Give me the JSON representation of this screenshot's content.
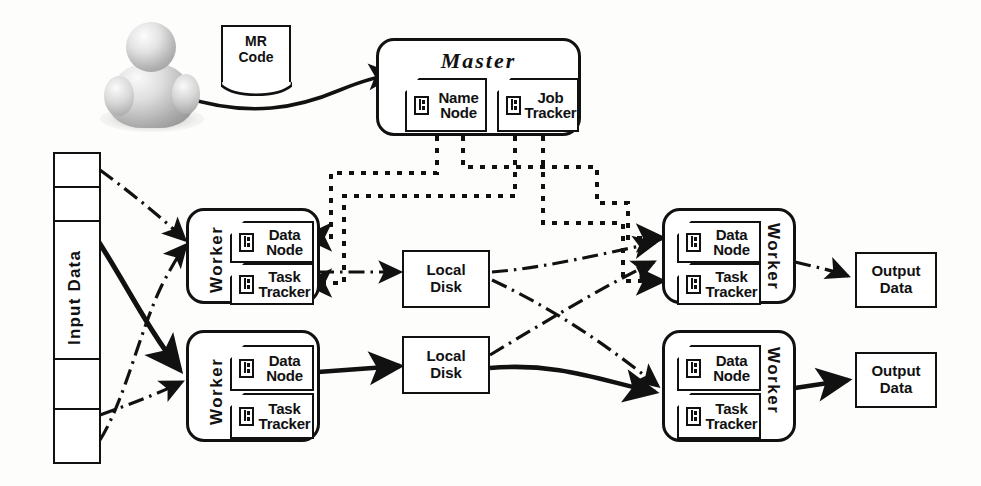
{
  "diagram": {
    "actor": {
      "name": "user",
      "icon": "person-icon"
    },
    "mr_code": {
      "label_line1": "MR",
      "label_line2": "Code",
      "icon": "document-icon"
    },
    "master": {
      "title": "Master",
      "components": [
        {
          "line1": "Name",
          "line2": "Node",
          "icon": "component-icon"
        },
        {
          "line1": "Job",
          "line2": "Tracker",
          "icon": "component-icon"
        }
      ]
    },
    "input": {
      "label": "Input Data",
      "segments": 6
    },
    "workers": [
      {
        "id": "worker-top-left",
        "label": "Worker",
        "label_side": "left",
        "components": [
          {
            "line1": "Data",
            "line2": "Node",
            "icon": "component-icon"
          },
          {
            "line1": "Task",
            "line2": "Tracker",
            "icon": "component-icon"
          }
        ]
      },
      {
        "id": "worker-bottom-left",
        "label": "Worker",
        "label_side": "left",
        "components": [
          {
            "line1": "Data",
            "line2": "Node",
            "icon": "component-icon"
          },
          {
            "line1": "Task",
            "line2": "Tracker",
            "icon": "component-icon"
          }
        ]
      },
      {
        "id": "worker-top-right",
        "label": "Worker",
        "label_side": "right",
        "components": [
          {
            "line1": "Data",
            "line2": "Node",
            "icon": "component-icon"
          },
          {
            "line1": "Task",
            "line2": "Tracker",
            "icon": "component-icon"
          }
        ]
      },
      {
        "id": "worker-bottom-right",
        "label": "Worker",
        "label_side": "right",
        "components": [
          {
            "line1": "Data",
            "line2": "Node",
            "icon": "component-icon"
          },
          {
            "line1": "Task",
            "line2": "Tracker",
            "icon": "component-icon"
          }
        ]
      }
    ],
    "local_disks": [
      {
        "id": "local-disk-top",
        "line1": "Local",
        "line2": "Disk"
      },
      {
        "id": "local-disk-bottom",
        "line1": "Local",
        "line2": "Disk"
      }
    ],
    "outputs": [
      {
        "id": "output-data-top",
        "line1": "Output",
        "line2": "Data"
      },
      {
        "id": "output-data-bottom",
        "line1": "Output",
        "line2": "Data"
      }
    ],
    "edge_styles": {
      "control": {
        "name": "dotted-control-flow",
        "pattern": "dotted",
        "color": "#111111"
      },
      "data_secondary": {
        "name": "dash-dot-data-flow",
        "pattern": "dash-dot",
        "color": "#111111"
      },
      "data_primary": {
        "name": "solid-data-flow",
        "pattern": "solid",
        "color": "#111111"
      }
    },
    "colors": {
      "ink": "#111111",
      "paper": "#fdfdfc",
      "avatar_gray": "#b4b4b4"
    }
  }
}
